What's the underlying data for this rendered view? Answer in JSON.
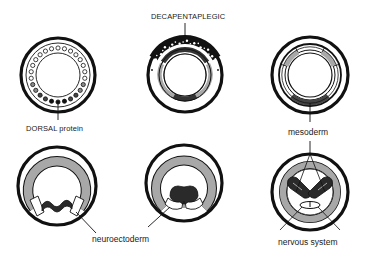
{
  "diagram": {
    "colors": {
      "stroke": "#111111",
      "mesoderm_gray": "#a8a8a8",
      "dark_fill": "#2a2a2a",
      "background": "#ffffff"
    },
    "panels": [
      {
        "id": "top-left",
        "stage": "DORSAL protein gradient",
        "label": "DORSAL protein"
      },
      {
        "id": "top-middle",
        "stage": "DECAPENTAPLEGIC dorsal",
        "label": "DECAPENTAPLEGIC"
      },
      {
        "id": "top-right",
        "stage": "mesoderm specified",
        "label": "mesoderm"
      },
      {
        "id": "bottom-left",
        "stage": "neuroectoderm invagination",
        "label": "neuroectoderm"
      },
      {
        "id": "bottom-middle",
        "stage": "ventral furrow",
        "label": ""
      },
      {
        "id": "bottom-right",
        "stage": "nervous system formed",
        "label": "nervous system"
      }
    ]
  },
  "labels": {
    "dorsal_protein": "DORSAL protein",
    "decapentaplegic": "DECAPENTAPLEGIC",
    "mesoderm": "mesoderm",
    "neuroectoderm": "neuroectoderm",
    "nervous_system": "nervous system"
  }
}
